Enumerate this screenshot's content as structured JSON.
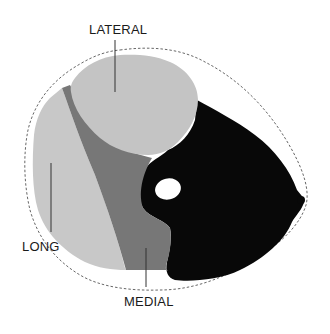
{
  "figure": {
    "labels": {
      "lateral": "LATERAL",
      "long": "LONG",
      "medial": "MEDIAL"
    },
    "colors": {
      "lateral_head": "#c4c4c4",
      "long_head": "#c8c8c8",
      "medial_head": "#777777",
      "other_tissue": "#080808",
      "bone": "#ffffff",
      "outline": "#555555",
      "leader_line": "#333333",
      "background": "#ffffff"
    }
  }
}
